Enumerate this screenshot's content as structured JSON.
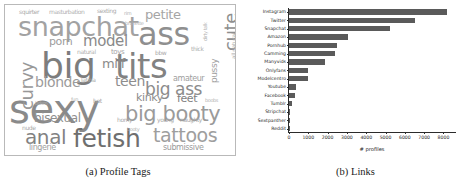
{
  "figure": {
    "panels": [
      {
        "id": "a",
        "caption": "(a) Profile Tags"
      },
      {
        "id": "b",
        "caption": "(b) Links"
      }
    ]
  },
  "wordcloud": {
    "type": "wordcloud",
    "title": "Profile Tags",
    "words": [
      {
        "text": "sexy",
        "size": 40,
        "color": "#8a8a8a",
        "x": 4,
        "y": 86,
        "rot": 0
      },
      {
        "text": "big",
        "size": 36,
        "color": "#7d7d7d",
        "x": 36,
        "y": 44,
        "rot": 0
      },
      {
        "text": "tits",
        "size": 34,
        "color": "#828282",
        "x": 110,
        "y": 46,
        "rot": 0
      },
      {
        "text": "ass",
        "size": 32,
        "color": "#8f8f8f",
        "x": 133,
        "y": 15,
        "rot": 0
      },
      {
        "text": "snapchat",
        "size": 27,
        "color": "#a2a2a2",
        "x": 13,
        "y": 10,
        "rot": 0
      },
      {
        "text": "fetish",
        "size": 25,
        "color": "#6f6f6f",
        "x": 68,
        "y": 122,
        "rot": 0
      },
      {
        "text": "big booty",
        "size": 21,
        "color": "#9a9a9a",
        "x": 120,
        "y": 100,
        "rot": 0
      },
      {
        "text": "tattoos",
        "size": 19,
        "color": "#9e9e9e",
        "x": 148,
        "y": 122,
        "rot": 0
      },
      {
        "text": "anal",
        "size": 20,
        "color": "#828282",
        "x": 20,
        "y": 123,
        "rot": 0
      },
      {
        "text": "big ass",
        "size": 17,
        "color": "#8c8c8c",
        "x": 140,
        "y": 77,
        "rot": 0
      },
      {
        "text": "curvy",
        "size": 18,
        "color": "#989898",
        "x": 14,
        "y": 105,
        "rot": -90
      },
      {
        "text": "cute",
        "size": 18,
        "color": "#8e8e8e",
        "x": 218,
        "y": 46,
        "rot": -90
      },
      {
        "text": "model",
        "size": 15,
        "color": "#8a8a8a",
        "x": 78,
        "y": 30,
        "rot": 0
      },
      {
        "text": "blonde",
        "size": 14,
        "color": "#9b9b9b",
        "x": 30,
        "y": 71,
        "rot": 0
      },
      {
        "text": "teen",
        "size": 14,
        "color": "#8d8d8d",
        "x": 110,
        "y": 70,
        "rot": 0
      },
      {
        "text": "bisexual",
        "size": 12,
        "color": "#8f8f8f",
        "x": 29,
        "y": 108,
        "rot": 0
      },
      {
        "text": "petite",
        "size": 13,
        "color": "#a5a5a5",
        "x": 140,
        "y": 4,
        "rot": 0
      },
      {
        "text": "porn",
        "size": 11,
        "color": "#9d9d9d",
        "x": 44,
        "y": 32,
        "rot": 0
      },
      {
        "text": "milf",
        "size": 13,
        "color": "#8b8b8b",
        "x": 97,
        "y": 53,
        "rot": 0
      },
      {
        "text": "kinky",
        "size": 11,
        "color": "#8d8d8d",
        "x": 131,
        "y": 88,
        "rot": 0
      },
      {
        "text": "feet",
        "size": 11,
        "color": "#7f7f7f",
        "x": 172,
        "y": 89,
        "rot": 0
      },
      {
        "text": "amateur",
        "size": 8,
        "color": "#9e9e9e",
        "x": 168,
        "y": 70,
        "rot": 0
      },
      {
        "text": "submissive",
        "size": 8,
        "color": "#9a9a9a",
        "x": 158,
        "y": 139,
        "rot": 0
      },
      {
        "text": "lingerie",
        "size": 8,
        "color": "#a0a0a0",
        "x": 24,
        "y": 139,
        "rot": 0
      },
      {
        "text": "pussy",
        "size": 9,
        "color": "#a0a0a0",
        "x": 205,
        "y": 78,
        "rot": -90
      },
      {
        "text": "all natural",
        "size": 6,
        "color": "#b0b0b0",
        "x": 226,
        "y": 54,
        "rot": -90
      },
      {
        "text": "dirty talk",
        "size": 5,
        "color": "#b2b2b2",
        "x": 198,
        "y": 36,
        "rot": -90
      },
      {
        "text": "thick",
        "size": 6,
        "color": "#aeaeae",
        "x": 186,
        "y": 41,
        "rot": 0
      },
      {
        "text": "bbw",
        "size": 6,
        "color": "#a8a8a8",
        "x": 150,
        "y": 45,
        "rot": 0
      },
      {
        "text": "squirter",
        "size": 6,
        "color": "#a9a9a9",
        "x": 14,
        "y": 4,
        "rot": 0
      },
      {
        "text": "masturbation",
        "size": 6,
        "color": "#b0b0b0",
        "x": 44,
        "y": 4,
        "rot": 0
      },
      {
        "text": "sexting",
        "size": 6,
        "color": "#aaaaaa",
        "x": 92,
        "y": 3,
        "rot": 0
      },
      {
        "text": "toys",
        "size": 7,
        "color": "#a4a4a4",
        "x": 106,
        "y": 44,
        "rot": 0
      },
      {
        "text": "natural",
        "size": 6,
        "color": "#b0b0b0",
        "x": 72,
        "y": 44,
        "rot": 0
      },
      {
        "text": "latina",
        "size": 6,
        "color": "#ababab",
        "x": 76,
        "y": 72,
        "rot": 0
      },
      {
        "text": "nude",
        "size": 6,
        "color": "#a8a8a8",
        "x": 17,
        "y": 120,
        "rot": 0
      },
      {
        "text": "horny",
        "size": 6,
        "color": "#aaaaaa",
        "x": 112,
        "y": 112,
        "rot": 0
      },
      {
        "text": "booty",
        "size": 5,
        "color": "#b0b0b0",
        "x": 122,
        "y": 122,
        "rot": 0
      },
      {
        "text": "young",
        "size": 6,
        "color": "#a9a9a9",
        "x": 152,
        "y": 112,
        "rot": 0
      },
      {
        "text": "naughty",
        "size": 6,
        "color": "#a9a9a9",
        "x": 175,
        "y": 112,
        "rot": 0
      },
      {
        "text": "hot",
        "size": 6,
        "color": "#a4a4a4",
        "x": 88,
        "y": 93,
        "rot": 0
      },
      {
        "text": "fun",
        "size": 5,
        "color": "#b0b0b0",
        "x": 66,
        "y": 92,
        "rot": 0
      },
      {
        "text": "boobs",
        "size": 5,
        "color": "#b2b2b2",
        "x": 200,
        "y": 93,
        "rot": 0
      },
      {
        "text": "brunette",
        "size": 5,
        "color": "#b2b2b2",
        "x": 120,
        "y": 16,
        "rot": 0
      },
      {
        "text": "rim",
        "size": 5,
        "color": "#b2b2b2",
        "x": 119,
        "y": 6,
        "rot": 0
      },
      {
        "text": "bdsm",
        "size": 5,
        "color": "#b2b2b2",
        "x": 30,
        "y": 96,
        "rot": 0
      }
    ]
  },
  "chart_data": {
    "type": "bar",
    "orientation": "horizontal",
    "title": "",
    "xlabel": "# profiles",
    "ylabel": "",
    "categories": [
      "Instagram",
      "Twitter",
      "Snapchat",
      "Amazon",
      "Pornhub",
      "Camming",
      "Manyvids",
      "Onlyfans",
      "Modelcentro",
      "Youtube",
      "Facebook",
      "Tumblr",
      "Stripchat",
      "Sextpanther",
      "Reddit"
    ],
    "values": [
      8200,
      6500,
      5250,
      3050,
      2500,
      2400,
      1850,
      1000,
      980,
      380,
      290,
      180,
      60,
      50,
      30
    ],
    "xlim": [
      0,
      8700
    ],
    "xticks": [
      0,
      1000,
      2000,
      3000,
      4000,
      5000,
      6000,
      7000,
      8000
    ],
    "xticklabels": [
      "0",
      "1000",
      "2000",
      "3000",
      "4000",
      "5000",
      "6000",
      "7000",
      "8000"
    ],
    "bar_color": "#5a5a5a",
    "grid": false,
    "legend": null
  }
}
